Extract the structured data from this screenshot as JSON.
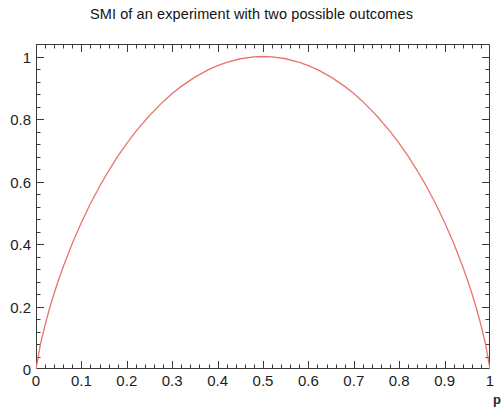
{
  "chart_data": {
    "type": "line",
    "title": "SMI of an experiment with two possible outcomes",
    "xlabel": "p",
    "ylabel": "",
    "xlim": [
      0,
      1
    ],
    "ylim": [
      0,
      1.04
    ],
    "grid": false,
    "legend": null,
    "series": [
      {
        "name": "H(p)",
        "color": "#e8756c",
        "x": [
          0.0,
          0.01,
          0.02,
          0.03,
          0.04,
          0.05,
          0.06,
          0.08,
          0.1,
          0.12,
          0.14,
          0.16,
          0.18,
          0.2,
          0.22,
          0.25,
          0.28,
          0.3,
          0.32,
          0.35,
          0.38,
          0.4,
          0.42,
          0.45,
          0.48,
          0.5,
          0.52,
          0.55,
          0.58,
          0.6,
          0.62,
          0.65,
          0.68,
          0.7,
          0.72,
          0.75,
          0.78,
          0.8,
          0.82,
          0.84,
          0.86,
          0.88,
          0.9,
          0.92,
          0.94,
          0.95,
          0.96,
          0.97,
          0.98,
          0.99,
          1.0
        ],
        "y": [
          0.0,
          0.0808,
          0.1414,
          0.1944,
          0.2423,
          0.2864,
          0.3274,
          0.4022,
          0.469,
          0.5294,
          0.5842,
          0.6343,
          0.6801,
          0.7219,
          0.7602,
          0.8113,
          0.8555,
          0.8813,
          0.9044,
          0.9341,
          0.958,
          0.971,
          0.9815,
          0.9928,
          0.9988,
          1.0,
          0.9988,
          0.9928,
          0.9815,
          0.971,
          0.958,
          0.9341,
          0.9044,
          0.8813,
          0.8555,
          0.8113,
          0.7602,
          0.7219,
          0.6801,
          0.6343,
          0.5842,
          0.5294,
          0.469,
          0.4022,
          0.3274,
          0.2864,
          0.2423,
          0.1944,
          0.1414,
          0.0808,
          0.0
        ]
      }
    ],
    "x_ticks": [
      {
        "value": 0,
        "label": "0"
      },
      {
        "value": 0.1,
        "label": "0.1"
      },
      {
        "value": 0.2,
        "label": "0.2"
      },
      {
        "value": 0.3,
        "label": "0.3"
      },
      {
        "value": 0.4,
        "label": "0.4"
      },
      {
        "value": 0.5,
        "label": "0.5"
      },
      {
        "value": 0.6,
        "label": "0.6"
      },
      {
        "value": 0.7,
        "label": "0.7"
      },
      {
        "value": 0.8,
        "label": "0.8"
      },
      {
        "value": 0.9,
        "label": "0.9"
      },
      {
        "value": 1.0,
        "label": "1"
      }
    ],
    "y_ticks": [
      {
        "value": 0,
        "label": "0"
      },
      {
        "value": 0.2,
        "label": "0.2"
      },
      {
        "value": 0.4,
        "label": "0.4"
      },
      {
        "value": 0.6,
        "label": "0.6"
      },
      {
        "value": 0.8,
        "label": "0.8"
      },
      {
        "value": 1.0,
        "label": "1"
      }
    ],
    "x_minor_per_major": 5,
    "y_minor_per_major": 5,
    "axis_color": "#3a3a3a",
    "frame": {
      "left": 36,
      "top": 44,
      "width": 454,
      "height": 325
    }
  }
}
